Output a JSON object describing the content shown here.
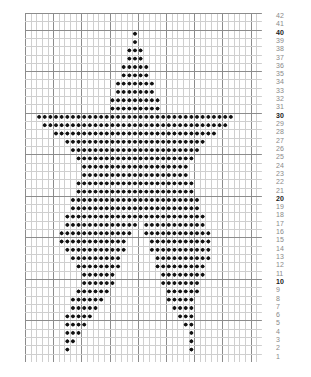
{
  "chart_data": {
    "type": "heatmap",
    "title": "",
    "subtitle": "",
    "xlabel": "",
    "ylabel": "",
    "grid": true,
    "legend_position": "none",
    "columns": 42,
    "rows": 42,
    "row_numbers_side": "right",
    "row_number_labels": [
      42,
      41,
      40,
      39,
      38,
      37,
      36,
      35,
      34,
      33,
      32,
      31,
      30,
      29,
      28,
      27,
      26,
      25,
      24,
      23,
      22,
      21,
      20,
      19,
      18,
      17,
      16,
      15,
      14,
      13,
      12,
      11,
      10,
      9,
      8,
      7,
      6,
      5,
      4,
      3,
      2,
      1
    ],
    "bold_row_numbers": [
      10,
      20,
      30,
      40
    ],
    "heavy_gridline_interval": 5,
    "symbol": "filled-diamond-stitch",
    "symbol_color": "#111111",
    "grid_line_color": "#cfcfcf",
    "heavy_grid_line_color": "#8c8c8c",
    "row_number_color": "#8a8a8a",
    "row_number_bold_color": "#1a1a1a",
    "background_color": "#ffffff",
    "filled_cells_by_row": {
      "42": [],
      "41": [],
      "40": [
        20
      ],
      "39": [
        20
      ],
      "38": [
        19,
        20,
        21
      ],
      "37": [
        19,
        20,
        21
      ],
      "36": [
        18,
        19,
        20,
        21,
        22
      ],
      "35": [
        18,
        19,
        20,
        21,
        22
      ],
      "34": [
        17,
        18,
        19,
        20,
        21,
        22,
        23
      ],
      "33": [
        17,
        18,
        19,
        20,
        21,
        22,
        23
      ],
      "32": [
        16,
        17,
        18,
        19,
        20,
        21,
        22,
        23,
        24
      ],
      "31": [
        16,
        17,
        18,
        19,
        20,
        21,
        22,
        23,
        24
      ],
      "30": [
        3,
        4,
        5,
        6,
        7,
        8,
        9,
        10,
        11,
        12,
        13,
        14,
        15,
        16,
        17,
        18,
        19,
        20,
        21,
        22,
        23,
        24,
        25,
        26,
        27,
        28,
        29,
        30,
        31,
        32,
        33,
        34,
        35,
        36,
        37
      ],
      "29": [
        4,
        5,
        6,
        7,
        8,
        9,
        10,
        11,
        12,
        13,
        14,
        15,
        16,
        17,
        18,
        19,
        20,
        21,
        22,
        23,
        24,
        25,
        26,
        27,
        28,
        29,
        30,
        31,
        32,
        33,
        34,
        35,
        36
      ],
      "28": [
        6,
        7,
        8,
        9,
        10,
        11,
        12,
        13,
        14,
        15,
        16,
        17,
        18,
        19,
        20,
        21,
        22,
        23,
        24,
        25,
        26,
        27,
        28,
        29,
        30,
        31,
        32,
        33,
        34
      ],
      "27": [
        8,
        9,
        10,
        11,
        12,
        13,
        14,
        15,
        16,
        17,
        18,
        19,
        20,
        21,
        22,
        23,
        24,
        25,
        26,
        27,
        28,
        29,
        30,
        31,
        32
      ],
      "26": [
        9,
        10,
        11,
        12,
        13,
        14,
        15,
        16,
        17,
        18,
        19,
        20,
        21,
        22,
        23,
        24,
        25,
        26,
        27,
        28,
        29,
        30,
        31
      ],
      "25": [
        10,
        11,
        12,
        13,
        14,
        15,
        16,
        17,
        18,
        19,
        20,
        21,
        22,
        23,
        24,
        25,
        26,
        27,
        28,
        29,
        30
      ],
      "24": [
        11,
        12,
        13,
        14,
        15,
        16,
        17,
        18,
        19,
        20,
        21,
        22,
        23,
        24,
        25,
        26,
        27,
        28,
        29
      ],
      "23": [
        11,
        12,
        13,
        14,
        15,
        16,
        17,
        18,
        19,
        20,
        21,
        22,
        23,
        24,
        25,
        26,
        27,
        28,
        29
      ],
      "22": [
        10,
        11,
        12,
        13,
        14,
        15,
        16,
        17,
        18,
        19,
        20,
        21,
        22,
        23,
        24,
        25,
        26,
        27,
        28,
        29,
        30
      ],
      "21": [
        10,
        11,
        12,
        13,
        14,
        15,
        16,
        17,
        18,
        19,
        20,
        21,
        22,
        23,
        24,
        25,
        26,
        27,
        28,
        29,
        30
      ],
      "20": [
        9,
        10,
        11,
        12,
        13,
        14,
        15,
        16,
        17,
        18,
        19,
        20,
        21,
        22,
        23,
        24,
        25,
        26,
        27,
        28,
        29,
        30,
        31
      ],
      "19": [
        9,
        10,
        11,
        12,
        13,
        14,
        15,
        16,
        17,
        18,
        19,
        20,
        21,
        22,
        23,
        24,
        25,
        26,
        27,
        28,
        29,
        30,
        31
      ],
      "18": [
        8,
        9,
        10,
        11,
        12,
        13,
        14,
        15,
        16,
        17,
        18,
        19,
        20,
        21,
        22,
        23,
        24,
        25,
        26,
        27,
        28,
        29,
        30,
        31,
        32
      ],
      "17": [
        8,
        9,
        10,
        11,
        12,
        13,
        14,
        15,
        16,
        17,
        18,
        19,
        20,
        22,
        23,
        24,
        25,
        26,
        27,
        28,
        29,
        30,
        31,
        32
      ],
      "16": [
        7,
        8,
        9,
        10,
        11,
        12,
        13,
        14,
        15,
        16,
        17,
        18,
        19,
        22,
        23,
        24,
        25,
        26,
        27,
        28,
        29,
        30,
        31,
        32,
        33
      ],
      "15": [
        7,
        8,
        9,
        10,
        11,
        12,
        13,
        14,
        15,
        16,
        17,
        18,
        23,
        24,
        25,
        26,
        27,
        28,
        29,
        30,
        31,
        32,
        33
      ],
      "14": [
        8,
        9,
        10,
        11,
        12,
        13,
        14,
        15,
        16,
        17,
        18,
        23,
        24,
        25,
        26,
        27,
        28,
        29,
        30,
        31,
        32,
        33
      ],
      "13": [
        9,
        10,
        11,
        12,
        13,
        14,
        15,
        16,
        17,
        24,
        25,
        26,
        27,
        28,
        29,
        30,
        31,
        32,
        33
      ],
      "12": [
        10,
        11,
        12,
        13,
        14,
        15,
        16,
        17,
        24,
        25,
        26,
        27,
        28,
        29,
        30,
        31,
        32
      ],
      "11": [
        11,
        12,
        13,
        14,
        15,
        16,
        25,
        26,
        27,
        28,
        29,
        30,
        31,
        32
      ],
      "10": [
        11,
        12,
        13,
        14,
        15,
        16,
        25,
        26,
        27,
        28,
        29,
        30,
        31
      ],
      "9": [
        10,
        11,
        12,
        13,
        14,
        15,
        26,
        27,
        28,
        29,
        30,
        31
      ],
      "8": [
        9,
        10,
        11,
        12,
        13,
        14,
        26,
        27,
        28,
        29,
        30
      ],
      "7": [
        9,
        10,
        11,
        12,
        13,
        27,
        28,
        29,
        30
      ],
      "6": [
        8,
        9,
        10,
        11,
        12,
        28,
        29,
        30
      ],
      "5": [
        8,
        9,
        10,
        11,
        29,
        30
      ],
      "4": [
        8,
        9,
        10,
        30
      ],
      "3": [
        8,
        9,
        30
      ],
      "2": [
        8,
        30
      ],
      "1": []
    }
  }
}
